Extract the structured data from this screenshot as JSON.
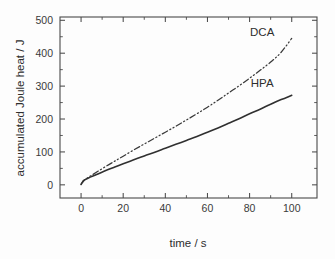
{
  "chart_data": {
    "type": "line",
    "title": "",
    "xlabel": "time / s",
    "ylabel": "accumulated Joule heat / J",
    "xlim": [
      -10,
      112
    ],
    "ylim": [
      -40,
      510
    ],
    "xticks": [
      0,
      20,
      40,
      60,
      80,
      100
    ],
    "yticks": [
      0,
      100,
      200,
      300,
      400,
      500
    ],
    "xminor_step": 10,
    "yminor_step": 50,
    "grid": false,
    "legend": "inline-annotations",
    "frame": "box",
    "tick_direction": "in",
    "annotations": [
      {
        "text": "DCA",
        "x": 86,
        "y": 452
      },
      {
        "text": "HPA",
        "x": 86,
        "y": 296
      }
    ],
    "series": [
      {
        "name": "DCA",
        "style": "dash-dot-dot",
        "x": [
          0,
          0.6,
          1.2,
          2,
          3,
          5,
          8,
          12,
          16,
          20,
          25,
          30,
          35,
          40,
          45,
          50,
          55,
          60,
          65,
          70,
          75,
          80,
          85,
          90,
          95,
          100
        ],
        "values": [
          2,
          8,
          13,
          17,
          21,
          29,
          41,
          57,
          72,
          87,
          106,
          124,
          142,
          160,
          178,
          197,
          216,
          236,
          257,
          279,
          301,
          324,
          348,
          373,
          403,
          445
        ]
      },
      {
        "name": "HPA",
        "style": "solid",
        "x": [
          0,
          0.6,
          1.2,
          2,
          3,
          5,
          8,
          12,
          16,
          20,
          25,
          30,
          35,
          40,
          45,
          50,
          55,
          60,
          65,
          70,
          75,
          80,
          85,
          90,
          95,
          100
        ],
        "values": [
          1,
          7,
          12,
          16,
          19,
          25,
          33,
          44,
          54,
          64,
          76,
          88,
          99,
          111,
          123,
          135,
          147,
          160,
          173,
          187,
          201,
          216,
          230,
          245,
          259,
          272
        ]
      }
    ]
  },
  "axis": {
    "x_title": "time / s",
    "y_title": "accumulated Joule heat / J",
    "x_tick_labels": [
      "0",
      "20",
      "40",
      "60",
      "80",
      "100"
    ],
    "y_tick_labels": [
      "0",
      "100",
      "200",
      "300",
      "400",
      "500"
    ]
  },
  "labels": {
    "dca": "DCA",
    "hpa": "HPA"
  },
  "colors": {
    "background": "#fdfdfd",
    "axis": "#4a4a4a",
    "curve_solid": "#303030",
    "curve_dashed": "#3a3a3a",
    "text": "#2e2e2e"
  }
}
